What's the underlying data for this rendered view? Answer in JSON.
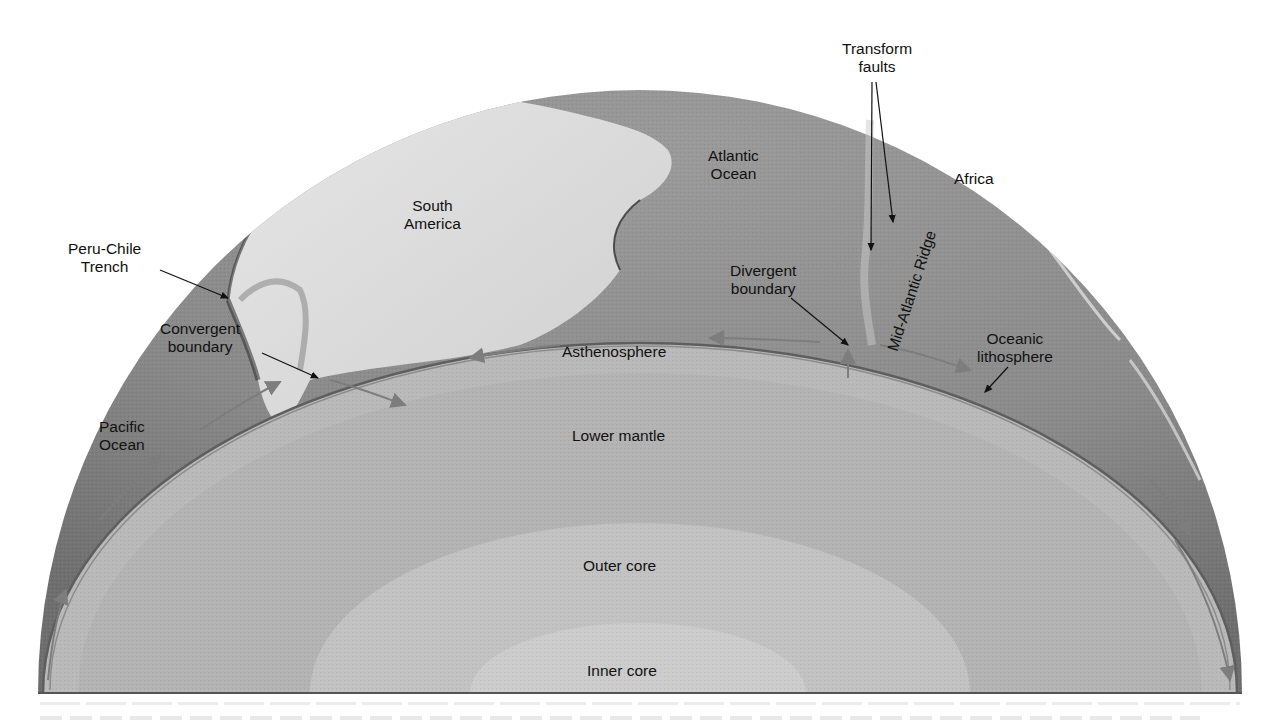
{
  "figure": {
    "type": "cutaway-earth-cross-section",
    "colors": {
      "background": "#ffffff",
      "surface_ocean": "#8e8e8e",
      "surface_land": "#d8d8d8",
      "lithosphere_line": "#6f6f6f",
      "asthenosphere": "#b9b9b9",
      "lower_mantle": "#b3b3b3",
      "outer_core": "#c2c2c2",
      "inner_core": "#cccccc",
      "baseline": "#555555",
      "label_text": "#111111"
    }
  },
  "labels": {
    "transform_faults": {
      "line1": "Transform",
      "line2": "faults"
    },
    "africa": "Africa",
    "atlantic_ocean": {
      "line1": "Atlantic",
      "line2": "Ocean"
    },
    "south_america": {
      "line1": "South",
      "line2": "America"
    },
    "peru_chile_trench": {
      "line1": "Peru-Chile",
      "line2": "Trench"
    },
    "divergent_boundary": {
      "line1": "Divergent",
      "line2": "boundary"
    },
    "mid_atlantic_ridge": "Mid-Atlantic Ridge",
    "convergent_boundary": {
      "line1": "Convergent",
      "line2": "boundary"
    },
    "oceanic_lithosphere": {
      "line1": "Oceanic",
      "line2": "lithosphere"
    },
    "pacific_ocean": {
      "line1": "Pacific",
      "line2": "Ocean"
    },
    "asthenosphere": "Asthenosphere",
    "lower_mantle": "Lower mantle",
    "outer_core": "Outer core",
    "inner_core": "Inner core"
  },
  "layers": [
    "Asthenosphere",
    "Lower mantle",
    "Outer core",
    "Inner core"
  ],
  "surface_features": [
    "Africa",
    "Atlantic Ocean",
    "South America",
    "Pacific Ocean",
    "Mid-Atlantic Ridge",
    "Peru-Chile Trench"
  ],
  "boundaries": [
    "Convergent boundary",
    "Divergent boundary",
    "Transform faults"
  ]
}
